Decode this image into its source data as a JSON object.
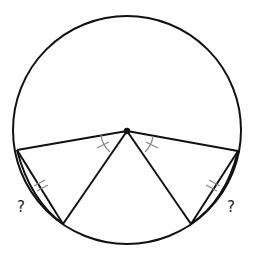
{
  "diagram": {
    "type": "circle-geometry",
    "circle": {
      "cx": 127,
      "cy": 130,
      "r": 114
    },
    "center_point": {
      "x": 127,
      "y": 131
    },
    "points": {
      "left": {
        "x": 17,
        "y": 150
      },
      "right": {
        "x": 238,
        "y": 151
      },
      "bottom_left": {
        "x": 63,
        "y": 224
      },
      "bottom_right": {
        "x": 191,
        "y": 224
      }
    },
    "labels": {
      "left_unknown": "?",
      "right_unknown": "?"
    },
    "colors": {
      "stroke": "#111111",
      "mark": "#888888"
    }
  }
}
